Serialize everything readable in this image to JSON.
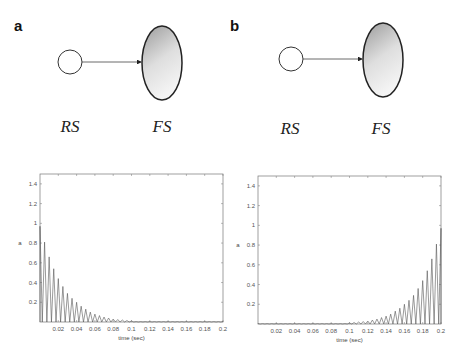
{
  "figure": {
    "panels": [
      {
        "id": "a",
        "label": "a",
        "diagram": {
          "source_node": {
            "label": "RS",
            "shape": "circle",
            "fill": "#ffffff"
          },
          "target_node": {
            "label": "FS",
            "shape": "ellipse",
            "fill_gradient": [
              "#a8a8a8",
              "#f2f2f2"
            ]
          },
          "edge": {
            "from": "RS",
            "to": "FS",
            "type": "arrow"
          }
        }
      },
      {
        "id": "b",
        "label": "b",
        "diagram": {
          "source_node": {
            "label": "RS",
            "shape": "circle",
            "fill": "#ffffff"
          },
          "target_node": {
            "label": "FS",
            "shape": "ellipse",
            "fill_gradient": [
              "#a8a8a8",
              "#f2f2f2"
            ]
          },
          "edge": {
            "from": "RS",
            "to": "FS",
            "type": "arrow"
          }
        }
      }
    ]
  },
  "chart_data": [
    {
      "panel": "a",
      "type": "line",
      "title": "",
      "xlabel": "time (sec)",
      "ylabel": "a",
      "xlim": [
        0,
        0.2
      ],
      "ylim": [
        0,
        1.5
      ],
      "xticks": [
        "0.02",
        "0.04",
        "0.06",
        "0.08",
        "0.1",
        "0.12",
        "0.14",
        "0.16",
        "0.18",
        "0.2"
      ],
      "yticks": [
        "0.2",
        "0.4",
        "0.6",
        "0.8",
        "1",
        "1.2",
        "1.4"
      ],
      "grid": false,
      "description": "Oscillating spikes with exponentially decaying amplitude starting at ~1.0 at t=0",
      "peaks": {
        "x": [
          0.0,
          0.005,
          0.01,
          0.015,
          0.02,
          0.025,
          0.03,
          0.035,
          0.04,
          0.045,
          0.05,
          0.055,
          0.06,
          0.065,
          0.07,
          0.075,
          0.08,
          0.085,
          0.09,
          0.095,
          0.1
        ],
        "y": [
          0.97,
          0.81,
          0.66,
          0.54,
          0.44,
          0.36,
          0.29,
          0.24,
          0.2,
          0.16,
          0.13,
          0.1,
          0.08,
          0.065,
          0.05,
          0.04,
          0.03,
          0.025,
          0.02,
          0.015,
          0.01
        ]
      }
    },
    {
      "panel": "b",
      "type": "line",
      "title": "",
      "xlabel": "time (sec)",
      "ylabel": "a",
      "xlim": [
        0,
        0.2
      ],
      "ylim": [
        0,
        1.5
      ],
      "xticks": [
        "0.02",
        "0.04",
        "0.06",
        "0.08",
        "0.1",
        "0.12",
        "0.14",
        "0.16",
        "0.18",
        "0.2"
      ],
      "yticks": [
        "0.2",
        "0.4",
        "0.6",
        "0.8",
        "1",
        "1.2",
        "1.4"
      ],
      "grid": false,
      "description": "Oscillating spikes with exponentially growing amplitude reaching ~1.0 at t=0.2",
      "peaks": {
        "x": [
          0.1,
          0.105,
          0.11,
          0.115,
          0.12,
          0.125,
          0.13,
          0.135,
          0.14,
          0.145,
          0.15,
          0.155,
          0.16,
          0.165,
          0.17,
          0.175,
          0.18,
          0.185,
          0.19,
          0.195,
          0.2
        ],
        "y": [
          0.01,
          0.015,
          0.02,
          0.025,
          0.03,
          0.04,
          0.05,
          0.065,
          0.08,
          0.1,
          0.13,
          0.16,
          0.2,
          0.24,
          0.29,
          0.36,
          0.44,
          0.54,
          0.66,
          0.81,
          0.97
        ]
      }
    }
  ]
}
